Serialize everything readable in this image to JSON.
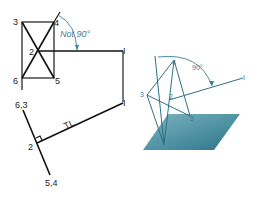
{
  "left_view": {
    "top_view_labels": {
      "p3": "3",
      "p4": "4",
      "p2": "2",
      "p6": "6",
      "p5": "5",
      "p1": "I"
    },
    "angle_note": "Not 90°",
    "edge_view_labels": {
      "p63": "6,3",
      "p2": "2",
      "p54": "5,4",
      "p1": "I",
      "true_length": "TL"
    }
  },
  "right_view": {
    "labels": {
      "p4": "4",
      "p3": "3",
      "p2": "2",
      "p5": "5",
      "p1": "I"
    },
    "angle_note": "90°",
    "plane_color": "#4a8fa0"
  }
}
